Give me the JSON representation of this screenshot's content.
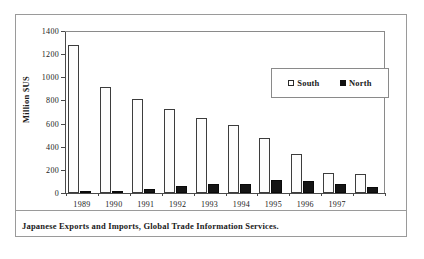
{
  "figure": {
    "caption": "Japanese Exports and Imports, Global Trade Information Services."
  },
  "chart_data": {
    "type": "bar",
    "title": "",
    "xlabel": "",
    "ylabel": "Million $US",
    "ylim": [
      0,
      1400
    ],
    "yticks": [
      0,
      200,
      400,
      600,
      800,
      1000,
      1200,
      1400
    ],
    "ytick_labels": [
      "0",
      "200",
      "400",
      "600",
      "800",
      "1000",
      "1200",
      "1400"
    ],
    "grid": false,
    "legend_position": "upper right",
    "categories": [
      "1989",
      "1990",
      "1991",
      "1992",
      "1993",
      "1994",
      "1995",
      "1996",
      "1997",
      ""
    ],
    "series": [
      {
        "name": "South",
        "color": "#ffffff",
        "edge_color": "#3d3d3d",
        "values": [
          1280,
          920,
          815,
          725,
          645,
          585,
          475,
          335,
          170,
          165
        ]
      },
      {
        "name": "North",
        "color": "#151515",
        "edge_color": "#0a0a0a",
        "values": [
          10,
          18,
          32,
          58,
          82,
          75,
          110,
          105,
          80,
          55
        ]
      }
    ]
  }
}
